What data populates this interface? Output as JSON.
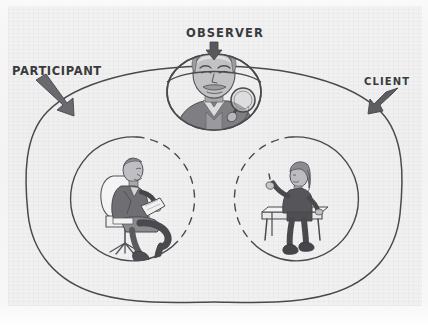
{
  "diagram": {
    "medium": "hand-drawn pencil sketch on textured paper",
    "labels": {
      "observer": "OBSERVER",
      "participant": "PARTICIPANT",
      "client": "CLIENT"
    },
    "arrows": [
      {
        "name": "observer-arrow",
        "direction": "down",
        "points_to": "observer-oval"
      },
      {
        "name": "participant-arrow",
        "direction": "down-right",
        "points_to": "outer-blob"
      },
      {
        "name": "client-arrow",
        "direction": "down-left",
        "points_to": "outer-blob"
      }
    ],
    "regions": [
      {
        "name": "outer-blob",
        "shape": "rounded blob / ellipse",
        "stroke": "solid"
      },
      {
        "name": "observer-oval",
        "shape": "oval",
        "stroke": "solid",
        "position": "top-center, straddling outer blob edge"
      },
      {
        "name": "participant-circle",
        "shape": "circle",
        "stroke": "solid outer arc, dashed inner arc",
        "position": "lower-left"
      },
      {
        "name": "client-circle",
        "shape": "circle",
        "stroke": "solid outer arc, dashed inner arc",
        "position": "lower-right"
      }
    ],
    "figures": [
      {
        "name": "observer-figure",
        "description": "bald man with mustache holding a magnifying glass",
        "region": "observer-oval"
      },
      {
        "name": "participant-figure",
        "description": "man seated in an office chair, legs crossed, holding a clipboard",
        "region": "participant-circle"
      },
      {
        "name": "client-figure",
        "description": "person with long hair seated on a bench, one hand raised gesturing",
        "region": "client-circle"
      }
    ],
    "colors": {
      "ink": "#3a3a3c",
      "line": "#4a4a4d",
      "paper": "#f2f2f3",
      "figure_fill": "#8d8d91",
      "figure_dark": "#5a5a5e",
      "figure_light": "#c9c9cc"
    }
  }
}
